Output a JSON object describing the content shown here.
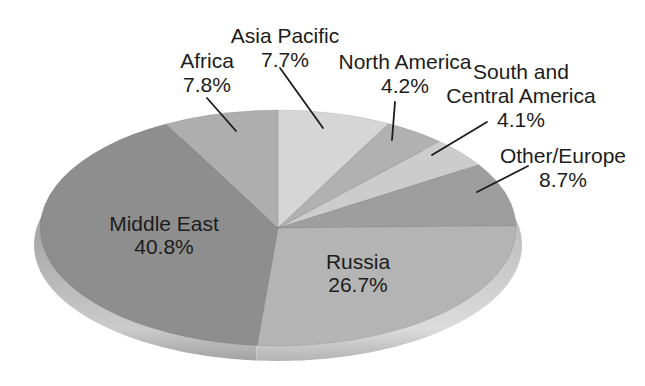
{
  "figure": {
    "background": "#ffffff",
    "text_color": "#1c1c1c",
    "leader_line_color": "#1c1c1c"
  },
  "chart_data": {
    "type": "pie",
    "style": "3d-ellipse",
    "title": "",
    "unit": "percent",
    "total": 100.0,
    "start_angle": "12-oclock-clockwise",
    "legend": "none",
    "slices": [
      {
        "label": "Asia Pacific",
        "label_lines": [
          "Asia Pacific"
        ],
        "pct_label": "7.7%",
        "value": 7.7,
        "color": "#d6d6d6",
        "label_style": "callout"
      },
      {
        "label": "North America",
        "label_lines": [
          "North America"
        ],
        "pct_label": "4.2%",
        "value": 4.2,
        "color": "#b1b1b1",
        "label_style": "callout"
      },
      {
        "label": "South and Central America",
        "label_lines": [
          "South and",
          "Central America"
        ],
        "pct_label": "4.1%",
        "value": 4.1,
        "color": "#cccccc",
        "label_style": "callout"
      },
      {
        "label": "Other/Europe",
        "label_lines": [
          "Other/Europe"
        ],
        "pct_label": "8.7%",
        "value": 8.7,
        "color": "#9e9e9e",
        "label_style": "callout"
      },
      {
        "label": "Russia",
        "label_lines": [
          "Russia"
        ],
        "pct_label": "26.7%",
        "value": 26.7,
        "color": "#b4b4b4",
        "label_style": "inside"
      },
      {
        "label": "Middle East",
        "label_lines": [
          "Middle East"
        ],
        "pct_label": "40.8%",
        "value": 40.8,
        "color": "#8e8e8e",
        "label_style": "inside"
      },
      {
        "label": "Africa",
        "label_lines": [
          "Africa"
        ],
        "pct_label": "7.8%",
        "value": 7.8,
        "color": "#aeaeae",
        "label_style": "callout"
      }
    ],
    "rim_colors": {
      "left_top": "#878787",
      "left_highlight": "#cbcbcb",
      "left_edge": "#a2a2a2",
      "right_top": "#a9a9a9",
      "right_highlight": "#dcdcdc",
      "right_edge": "#b4b4b4"
    }
  }
}
